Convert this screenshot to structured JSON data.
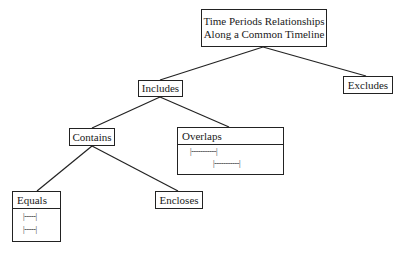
{
  "diagram": {
    "type": "tree",
    "root": {
      "label_line1": "Time Periods Relationships",
      "label_line2": "Along a Common Timeline"
    },
    "nodes": {
      "includes": {
        "label": "Includes"
      },
      "excludes": {
        "label": "Excludes"
      },
      "contains": {
        "label": "Contains"
      },
      "overlaps": {
        "label": "Overlaps",
        "timelines": [
          "|-----------|",
          "|-----------|"
        ]
      },
      "equals": {
        "label": "Equals",
        "timelines": [
          "|-----|",
          "|-----|"
        ]
      },
      "encloses": {
        "label": "Encloses"
      }
    },
    "edges": [
      [
        "root",
        "includes"
      ],
      [
        "root",
        "excludes"
      ],
      [
        "includes",
        "contains"
      ],
      [
        "includes",
        "overlaps"
      ],
      [
        "contains",
        "equals"
      ],
      [
        "contains",
        "encloses"
      ]
    ],
    "colors": {
      "line": "#222222",
      "background": "#ffffff"
    }
  }
}
